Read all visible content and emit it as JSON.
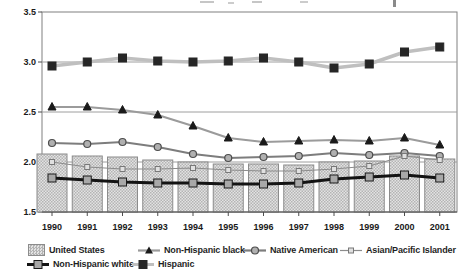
{
  "chart_data": {
    "type": "combo-bar-line",
    "title": "",
    "xlabel": "",
    "ylabel": "",
    "categories": [
      "1990",
      "1991",
      "1992",
      "1993",
      "1994",
      "1995",
      "1996",
      "1997",
      "1998",
      "1999",
      "2000",
      "2001"
    ],
    "ylim": [
      1.5,
      3.5
    ],
    "yticks": [
      1.5,
      2.0,
      2.5,
      3.0,
      3.5
    ],
    "ytick_labels": [
      "1.5",
      "2.0",
      "2.5",
      "3.0",
      "3.5"
    ],
    "grid": true,
    "legend_position": "bottom",
    "series": [
      {
        "name": "United States",
        "type": "bar",
        "values": [
          2.08,
          2.06,
          2.05,
          2.02,
          2.0,
          1.98,
          1.98,
          1.97,
          2.0,
          2.01,
          2.06,
          2.03
        ],
        "bar_fill_light": "#e3e3e3",
        "bar_fill_dark": "#b4b4b4",
        "bar_border": "#8c8c8c"
      },
      {
        "name": "Non-Hispanic black",
        "type": "line",
        "marker": "triangle",
        "values": [
          2.55,
          2.55,
          2.52,
          2.47,
          2.36,
          2.24,
          2.2,
          2.21,
          2.22,
          2.21,
          2.24,
          2.17
        ],
        "line_color": "#9b9b9b",
        "line_width": 2.2,
        "marker_fill": "#1a1a1a",
        "marker_stroke": "#1a1a1a",
        "marker_size": 8
      },
      {
        "name": "Native American",
        "type": "line",
        "marker": "circle",
        "values": [
          2.19,
          2.18,
          2.2,
          2.15,
          2.08,
          2.04,
          2.05,
          2.06,
          2.09,
          2.07,
          2.09,
          2.06
        ],
        "line_color": "#7d7d7d",
        "line_width": 2.2,
        "marker_fill": "#b0b0b0",
        "marker_stroke": "#4d4d4d",
        "marker_size": 7
      },
      {
        "name": "Asian/Pacific Islander",
        "type": "line",
        "marker": "open-square",
        "values": [
          2.0,
          1.95,
          1.93,
          1.93,
          1.94,
          1.92,
          1.91,
          1.91,
          1.93,
          1.96,
          2.06,
          2.02
        ],
        "line_color": "#8c8c8c",
        "line_width": 1.2,
        "marker_fill": "#e0e0e0",
        "marker_stroke": "#787878",
        "marker_size": 5
      },
      {
        "name": "Non-Hispanic white",
        "type": "line",
        "marker": "square",
        "values": [
          1.84,
          1.82,
          1.8,
          1.79,
          1.79,
          1.78,
          1.78,
          1.79,
          1.83,
          1.85,
          1.87,
          1.84
        ],
        "line_color": "#141414",
        "line_width": 3.2,
        "marker_fill": "#a8a8a8",
        "marker_stroke": "#1a1a1a",
        "marker_size": 8
      },
      {
        "name": "Hispanic",
        "type": "line",
        "marker": "square",
        "values": [
          2.96,
          3.0,
          3.04,
          3.01,
          3.0,
          3.01,
          3.04,
          3.0,
          2.94,
          2.98,
          3.1,
          3.15
        ],
        "line_color": "#bfbfbf",
        "line_width": 3.5,
        "marker_fill": "#262626",
        "marker_stroke": "#262626",
        "marker_size": 8
      }
    ]
  },
  "colors": {
    "background": "#ffffff",
    "frame": "#808080",
    "gridline": "#9e9e9e",
    "axis": "#4d4d4d",
    "text": "#1a1a1a"
  }
}
